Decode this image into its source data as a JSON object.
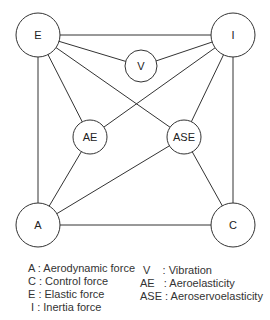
{
  "diagram": {
    "nodes": [
      {
        "id": "E",
        "label": "E",
        "cx": 38,
        "cy": 35,
        "r": 22
      },
      {
        "id": "I",
        "label": "I",
        "cx": 233,
        "cy": 35,
        "r": 22
      },
      {
        "id": "V",
        "label": "V",
        "cx": 141,
        "cy": 66,
        "r": 16
      },
      {
        "id": "AE",
        "label": "AE",
        "cx": 90,
        "cy": 137,
        "r": 17
      },
      {
        "id": "ASE",
        "label": "ASE",
        "cx": 184,
        "cy": 137,
        "r": 17
      },
      {
        "id": "A",
        "label": "A",
        "cx": 38,
        "cy": 225,
        "r": 22
      },
      {
        "id": "C",
        "label": "C",
        "cx": 233,
        "cy": 225,
        "r": 22
      }
    ],
    "edges": [
      [
        "E",
        "I"
      ],
      [
        "E",
        "V"
      ],
      [
        "I",
        "V"
      ],
      [
        "E",
        "AE"
      ],
      [
        "E",
        "ASE"
      ],
      [
        "I",
        "AE"
      ],
      [
        "I",
        "ASE"
      ],
      [
        "E",
        "A"
      ],
      [
        "I",
        "C"
      ],
      [
        "A",
        "AE"
      ],
      [
        "A",
        "ASE"
      ],
      [
        "C",
        "ASE"
      ],
      [
        "A",
        "C"
      ]
    ]
  },
  "legend": {
    "left": [
      {
        "text": "A : Aerodynamic force"
      },
      {
        "text": "C : Control force"
      },
      {
        "text": "E : Elastic force"
      },
      {
        "text": " I : Inertia force"
      }
    ],
    "right": [
      {
        "text": " V    : Vibration"
      },
      {
        "text": "AE   : Aeroelasticity"
      },
      {
        "text": "ASE : Aeroservoelasticity"
      }
    ]
  }
}
